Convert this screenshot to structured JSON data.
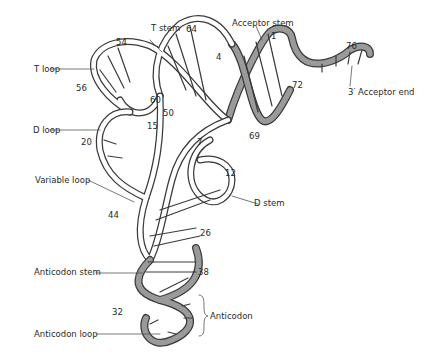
{
  "diagram": {
    "colors": {
      "strand_fill": "#ffffff",
      "strand_outline": "#3a3a3a",
      "shaded_strand": "#9a9a9a",
      "leader": "#555555"
    },
    "labels": {
      "t_stem": "T stem",
      "acceptor_stem": "Acceptor stem",
      "t_loop": "T loop",
      "d_loop": "D loop",
      "acceptor_end": "3′ Acceptor end",
      "variable_loop": "Variable loop",
      "d_stem": "D stem",
      "anticodon_stem": "Anticodon stem",
      "anticodon": "Anticodon",
      "anticodon_loop": "Anticodon loop"
    },
    "positions": {
      "n1": "1",
      "n4": "4",
      "n7": "7",
      "n12": "12",
      "n15": "15",
      "n20": "20",
      "n26": "26",
      "n32": "32",
      "n38": "38",
      "n44": "44",
      "n50": "50",
      "n54": "54",
      "n56": "56",
      "n60": "60",
      "n64": "64",
      "n69": "69",
      "n72": "72",
      "n76": "76"
    }
  }
}
